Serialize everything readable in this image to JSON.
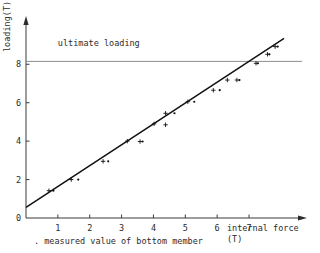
{
  "chart_data": {
    "type": "scatter",
    "title": "",
    "xlabel": "internal force (T)",
    "ylabel": "loading(T)",
    "xlabel_line1": "internal force",
    "xlabel_line2": "(T)",
    "xlim": [
      0,
      8.6
    ],
    "ylim": [
      0,
      10.2
    ],
    "xticks": [
      1,
      2,
      3,
      4,
      5,
      6,
      7
    ],
    "xtick_labels": [
      "1",
      "2",
      "3",
      "4",
      "5",
      "6",
      "7"
    ],
    "yticks": [
      0,
      2,
      4,
      6,
      8
    ],
    "ytick_labels": [
      "0",
      "2",
      "4",
      "6",
      "8"
    ],
    "grid": false,
    "legend": "none",
    "annotations": [
      {
        "text": "ultimate loading",
        "x": 1.0,
        "y": 8.95
      }
    ],
    "caption": ". measured value of bottom member",
    "reference_lines": [
      {
        "name": "ultimate loading",
        "orientation": "horizontal",
        "y": 8.15,
        "style": "thin-grey"
      }
    ],
    "fit_line": {
      "name": "trend line",
      "x0": 0.0,
      "y0": 0.55,
      "x1": 8.1,
      "y1": 9.35
    },
    "series": [
      {
        "name": "plus markers",
        "marker": "plus",
        "points": [
          [
            0.72,
            1.42
          ],
          [
            1.42,
            2.0
          ],
          [
            2.42,
            2.95
          ],
          [
            3.18,
            4.0
          ],
          [
            3.58,
            3.98
          ],
          [
            4.02,
            4.9
          ],
          [
            4.38,
            5.45
          ],
          [
            4.38,
            4.85
          ],
          [
            5.08,
            6.05
          ],
          [
            5.88,
            6.65
          ],
          [
            6.32,
            7.18
          ],
          [
            6.62,
            7.18
          ],
          [
            7.22,
            8.05
          ],
          [
            7.58,
            8.52
          ],
          [
            7.82,
            8.92
          ]
        ]
      },
      {
        "name": "dot markers",
        "marker": "dot",
        "points": [
          [
            0.86,
            1.42
          ],
          [
            1.64,
            2.0
          ],
          [
            2.58,
            2.95
          ],
          [
            3.66,
            3.98
          ],
          [
            4.66,
            5.45
          ],
          [
            5.28,
            6.05
          ],
          [
            6.08,
            6.65
          ],
          [
            6.7,
            7.18
          ],
          [
            7.28,
            8.05
          ],
          [
            7.64,
            8.52
          ],
          [
            7.9,
            8.92
          ]
        ]
      }
    ]
  }
}
